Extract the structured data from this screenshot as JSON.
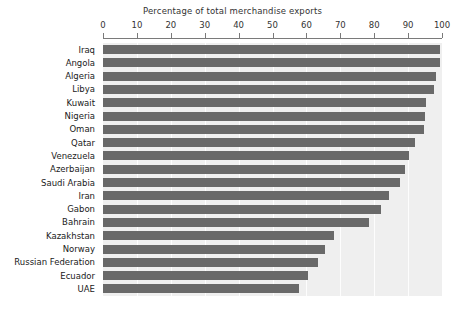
{
  "chart_data": {
    "type": "bar",
    "orientation": "horizontal",
    "title": "Percentage of total merchandise exports",
    "xlabel": "",
    "ylabel": "",
    "xlim": [
      0,
      100
    ],
    "xticks": [
      0,
      10,
      20,
      30,
      40,
      50,
      60,
      70,
      80,
      90,
      100
    ],
    "grid": true,
    "legend": null,
    "bar_color": "#696969",
    "plot_background": "#efefef",
    "categories": [
      "Iraq",
      "Angola",
      "Algeria",
      "Libya",
      "Kuwait",
      "Nigeria",
      "Oman",
      "Qatar",
      "Venezuela",
      "Azerbaijan",
      "Saudi Arabia",
      "Iran",
      "Gabon",
      "Bahrain",
      "Kazakhstan",
      "Norway",
      "Russian Federation",
      "Ecuador",
      "UAE"
    ],
    "values": [
      99.5,
      99.3,
      98.3,
      97.5,
      95.3,
      95.0,
      94.8,
      92.0,
      90.3,
      89.0,
      87.5,
      84.5,
      82.0,
      78.5,
      68.0,
      65.5,
      63.5,
      60.5,
      57.7
    ]
  }
}
